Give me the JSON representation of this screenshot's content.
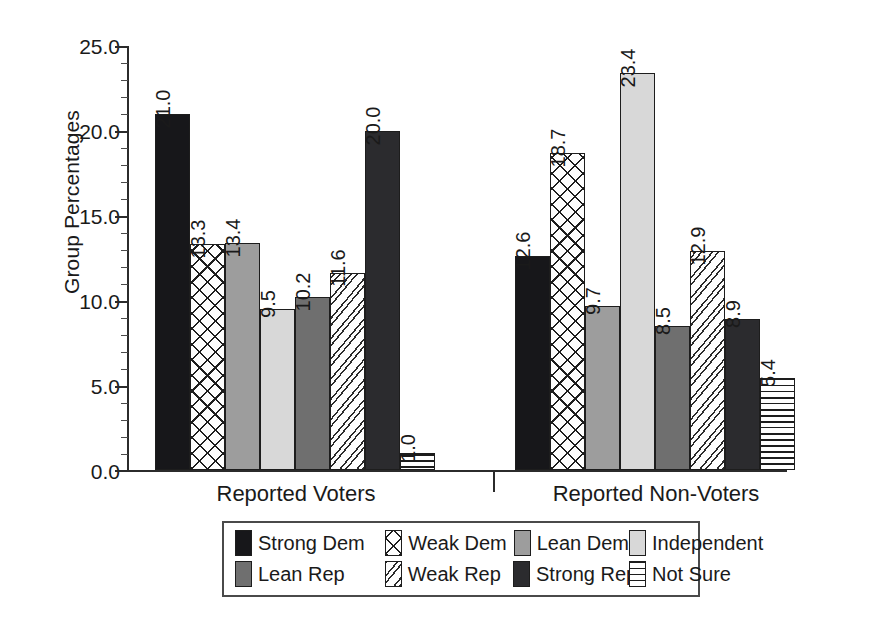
{
  "chart_data": {
    "type": "bar",
    "title": "",
    "subtitle": "",
    "xlabel": "",
    "ylabel": "Group Percentages",
    "categories": [
      "Reported Voters",
      "Reported Non-Voters"
    ],
    "ylim": [
      0.0,
      25.0
    ],
    "ytick_labels": [
      "0.0",
      "5.0",
      "10.0",
      "15.0",
      "20.0",
      "25.0"
    ],
    "ytick_values": [
      0.0,
      5.0,
      10.0,
      15.0,
      20.0,
      25.0
    ],
    "grid": false,
    "legend_position": "bottom",
    "value_labels_rotated": true,
    "series": [
      {
        "name": "Strong Dem",
        "fill": "solid-black",
        "values": [
          21.0,
          12.6
        ],
        "labels": [
          "21.0",
          "12.6"
        ]
      },
      {
        "name": "Weak Dem",
        "fill": "crosshatch-diagonal",
        "values": [
          13.3,
          18.7
        ],
        "labels": [
          "13.3",
          "18.7"
        ]
      },
      {
        "name": "Lean Dem",
        "fill": "solid-mid-gray",
        "values": [
          13.4,
          9.7
        ],
        "labels": [
          "13.4",
          "9.7"
        ]
      },
      {
        "name": "Independent",
        "fill": "solid-light-gray",
        "values": [
          9.5,
          23.4
        ],
        "labels": [
          "9.5",
          "23.4"
        ]
      },
      {
        "name": "Lean Rep",
        "fill": "solid-dark-gray",
        "values": [
          10.2,
          8.5
        ],
        "labels": [
          "10.2",
          "8.5"
        ]
      },
      {
        "name": "Weak Rep",
        "fill": "dotted-diagonal",
        "values": [
          11.6,
          12.9
        ],
        "labels": [
          "11.6",
          "12.9"
        ]
      },
      {
        "name": "Strong Rep",
        "fill": "solid-near-black",
        "values": [
          20.0,
          8.9
        ],
        "labels": [
          "20.0",
          "8.9"
        ]
      },
      {
        "name": "Not Sure",
        "fill": "horizontal-lines",
        "values": [
          1.0,
          5.4
        ],
        "labels": [
          "1.0",
          "5.4"
        ]
      }
    ]
  },
  "axis": {
    "y_title": "Group Percentages",
    "y_ticks": [
      "25.0",
      "20.0",
      "15.0",
      "10.0",
      "5.0",
      "0.0"
    ]
  },
  "groups": [
    {
      "label": "Reported Voters"
    },
    {
      "label": "Reported Non-Voters"
    }
  ],
  "legend": {
    "items": [
      {
        "label": "Strong Dem"
      },
      {
        "label": "Weak Dem"
      },
      {
        "label": "Lean Dem"
      },
      {
        "label": "Independent"
      },
      {
        "label": "Lean Rep"
      },
      {
        "label": "Weak Rep"
      },
      {
        "label": "Strong Rep"
      },
      {
        "label": "Not Sure"
      }
    ]
  },
  "colors": {
    "strong_dem": "#17171a",
    "lean_dem": "#9d9d9d",
    "independent": "#d8d8d8",
    "lean_rep": "#6f6f6f",
    "strong_rep": "#2b2b2e",
    "axis": "#2b2b2b",
    "background": "#ffffff"
  }
}
